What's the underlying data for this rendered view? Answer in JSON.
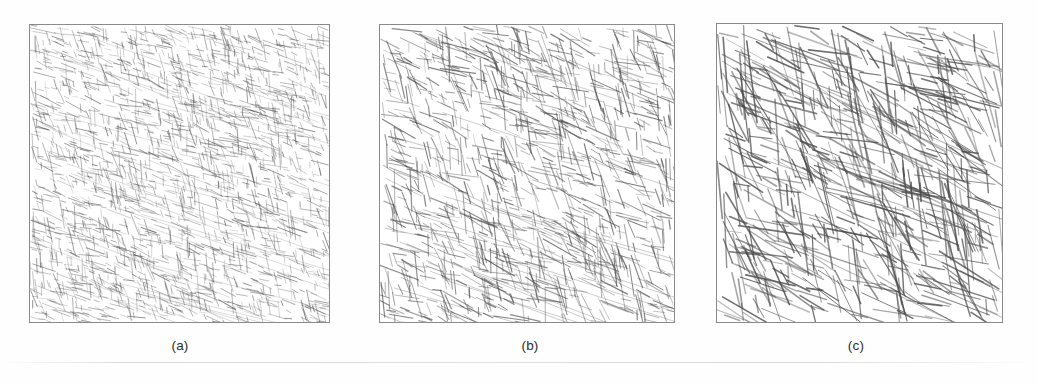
{
  "figure": {
    "background_color": "#fefefe",
    "panel_border_color": "#8a8a8a",
    "ink_color": "#4a4a4a",
    "caption_color": "#2d2d2d",
    "width": 1038,
    "height": 384
  },
  "panels": [
    {
      "id": "panel-a",
      "caption": "(a)",
      "x": 29,
      "y": 24,
      "width": 301,
      "height": 299,
      "caption_x": 180,
      "caption_y": 338,
      "seed": 1741,
      "segment_count": 2100,
      "min_length": 5,
      "max_length": 26,
      "stroke_width": 0.75,
      "opacity": 0.62,
      "orientation_primary_deg": 18,
      "orientation_secondary_deg": 78,
      "orientation_jitter_deg": 13,
      "secondary_fraction": 0.42
    },
    {
      "id": "panel-b",
      "caption": "(b)",
      "x": 379,
      "y": 24,
      "width": 296,
      "height": 299,
      "caption_x": 530,
      "caption_y": 338,
      "seed": 9043,
      "segment_count": 1250,
      "min_length": 9,
      "max_length": 42,
      "stroke_width": 0.95,
      "opacity": 0.7,
      "orientation_primary_deg": 20,
      "orientation_secondary_deg": 76,
      "orientation_jitter_deg": 14,
      "secondary_fraction": 0.45
    },
    {
      "id": "panel-c",
      "caption": "(c)",
      "x": 716,
      "y": 23,
      "width": 287,
      "height": 300,
      "caption_x": 856,
      "caption_y": 338,
      "seed": 5527,
      "segment_count": 720,
      "min_length": 16,
      "max_length": 86,
      "stroke_width": 1.25,
      "opacity": 0.8,
      "orientation_primary_deg": 22,
      "orientation_secondary_deg": 72,
      "orientation_jitter_deg": 16,
      "secondary_fraction": 0.47
    }
  ],
  "scan_artifact": {
    "y": 362
  }
}
